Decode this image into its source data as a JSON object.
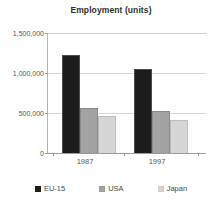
{
  "chart_data": {
    "type": "bar",
    "title": "Employment (units)",
    "xlabel": "",
    "ylabel": "",
    "categories": [
      "1987",
      "1997"
    ],
    "series": [
      {
        "name": "EU-15",
        "color": "#1c1c1c",
        "values": [
          1225000,
          1050000
        ]
      },
      {
        "name": "USA",
        "color": "#a3a3a3",
        "values": [
          560000,
          525000
        ]
      },
      {
        "name": "Japan",
        "color": "#d6d6d6",
        "values": [
          460000,
          410000
        ]
      }
    ],
    "ylim": [
      0,
      1500000
    ],
    "ytick_labels": [
      "1,500,000",
      "1,000,000",
      "500,000",
      "0"
    ],
    "ytick_values": [
      1500000,
      1000000,
      500000,
      0
    ],
    "grid": true,
    "legend_position": "bottom"
  }
}
